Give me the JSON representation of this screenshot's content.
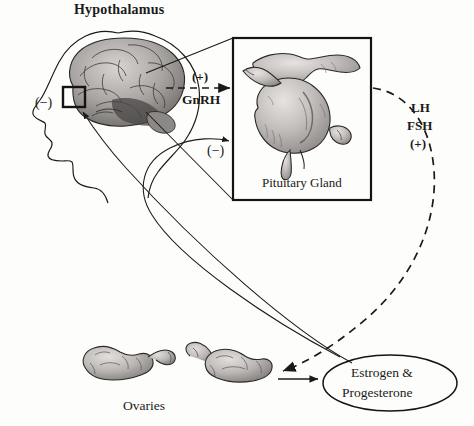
{
  "figure": {
    "type": "diagram",
    "background_color": "#fdfdfb",
    "ink_color": "#1a1a1a"
  },
  "labels": {
    "hypothalamus": "Hypothalamus",
    "pituitary_gland": "Pituitary Gland",
    "ovaries": "Ovaries",
    "estrogen_line1": "Estrogen &",
    "estrogen_line2": "Progesterone",
    "gnrh": "GnRH",
    "plus_gnrh": "(+)",
    "lh": "LH",
    "fsh": "FSH",
    "plus_lhfsh": "(+)",
    "minus_hypothalamus": "(−)",
    "minus_pituitary": "(−)"
  },
  "nodes": [
    {
      "name": "hypothalamus",
      "label": "Hypothalamus",
      "illustration": "brain-in-head-profile"
    },
    {
      "name": "pituitary-gland",
      "label": "Pituitary Gland",
      "illustration": "pituitary-gland-drawing",
      "boxed": true
    },
    {
      "name": "ovaries",
      "label": "Ovaries",
      "illustration": "paired-ovaries-drawing"
    },
    {
      "name": "estrogen-progesterone",
      "label": "Estrogen & Progesterone",
      "shape": "ellipse"
    }
  ],
  "edges": [
    {
      "name": "gnrh-arrow",
      "from": "hypothalamus",
      "to": "pituitary-gland",
      "style": "dashed",
      "label": "GnRH",
      "sign": "(+)"
    },
    {
      "name": "lh-fsh-arrow",
      "from": "pituitary-gland",
      "to": "ovaries",
      "style": "dashed",
      "label": "LH FSH",
      "sign": "(+)"
    },
    {
      "name": "ovaries-to-hormones-arrow",
      "from": "ovaries",
      "to": "estrogen-progesterone",
      "style": "solid",
      "label": "",
      "sign": ""
    },
    {
      "name": "negative-feedback-hypothalamus",
      "from": "estrogen-progesterone",
      "to": "hypothalamus",
      "style": "solid",
      "label": "",
      "sign": "(−)"
    },
    {
      "name": "negative-feedback-pituitary",
      "from": "estrogen-progesterone",
      "to": "pituitary-gland",
      "style": "solid",
      "label": "",
      "sign": "(−)"
    }
  ]
}
